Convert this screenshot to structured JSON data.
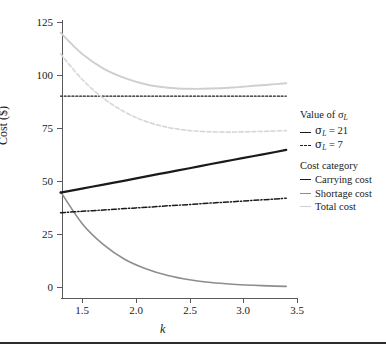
{
  "figure": {
    "background": "#ffffff",
    "bottom_rule_color": "#2b2b2b"
  },
  "axes": {
    "y_title": "Cost ($)",
    "x_title": "k",
    "y_ticks": [
      "0",
      "25",
      "50",
      "75",
      "100",
      "125"
    ],
    "x_ticks": [
      "1.5",
      "2.0",
      "2.5",
      "3.0",
      "3.5"
    ]
  },
  "legend": {
    "group1_title": "Value of σ",
    "group1_title_sub": "L",
    "group2_title": "Cost category",
    "items_sigma": [
      {
        "label_pre": "σ",
        "label_sub": "L",
        "label_post": " = 21",
        "style": "solid-dark"
      },
      {
        "label_pre": "σ",
        "label_sub": "L",
        "label_post": " = 7",
        "style": "dashdot-dark"
      }
    ],
    "items_category": [
      {
        "label": "Carrying cost",
        "style": "solid-dark",
        "color": "#1a1a1a"
      },
      {
        "label": "Shortage cost",
        "style": "solid-mid",
        "color": "#8d8d8d"
      },
      {
        "label": "Total cost",
        "style": "solid-light",
        "color": "#cfcfcf"
      }
    ]
  },
  "chart_data": {
    "type": "line",
    "title": "",
    "xlabel": "k",
    "ylabel": "Cost ($)",
    "xlim": [
      1.3,
      3.4
    ],
    "ylim": [
      0,
      125
    ],
    "grid": false,
    "legend_position": "right",
    "x": [
      1.3,
      1.5,
      1.7,
      1.9,
      2.1,
      2.3,
      2.5,
      2.7,
      2.9,
      3.1,
      3.3,
      3.4
    ],
    "series": [
      {
        "name": "Carrying cost (σ_L = 21)",
        "style": "solid",
        "color": "#1a1a1a",
        "width": 2.2,
        "values": [
          44.5,
          46.4,
          48.3,
          50.2,
          52.2,
          54.1,
          56.0,
          58.0,
          59.9,
          61.8,
          63.7,
          64.7
        ]
      },
      {
        "name": "Carrying cost (σ_L = 7)",
        "style": "dash-dot",
        "color": "#1a1a1a",
        "width": 1.5,
        "values": [
          35.0,
          35.7,
          36.3,
          37.0,
          37.6,
          38.3,
          38.9,
          39.6,
          40.2,
          40.9,
          41.5,
          41.9
        ]
      },
      {
        "name": "Shortage cost (σ_L = 21)",
        "style": "solid",
        "color": "#8d8d8d",
        "width": 1.6,
        "values": [
          45.0,
          30.0,
          20.0,
          13.0,
          8.5,
          5.4,
          3.4,
          2.1,
          1.3,
          0.8,
          0.4,
          0.3
        ]
      },
      {
        "name": "Total cost (σ_L = 21)",
        "style": "solid",
        "color": "#cfcfcf",
        "width": 1.9,
        "values": [
          120.0,
          110.0,
          103.0,
          98.5,
          95.5,
          94.0,
          93.5,
          93.6,
          94.1,
          94.9,
          95.7,
          96.1
        ]
      },
      {
        "name": "Total cost (σ_L = 7)",
        "style": "dashed",
        "color": "#d8d8d8",
        "width": 1.7,
        "values": [
          110.0,
          98.0,
          89.0,
          82.5,
          78.0,
          75.3,
          73.8,
          73.2,
          73.1,
          73.3,
          73.6,
          73.8
        ]
      },
      {
        "name": "Reference level",
        "style": "dotted",
        "color": "#1a1a1a",
        "width": 1.2,
        "values": [
          90.0,
          90.0,
          90.0,
          90.0,
          90.0,
          90.0,
          90.0,
          90.0,
          90.0,
          90.0,
          90.0,
          90.0
        ]
      }
    ]
  }
}
